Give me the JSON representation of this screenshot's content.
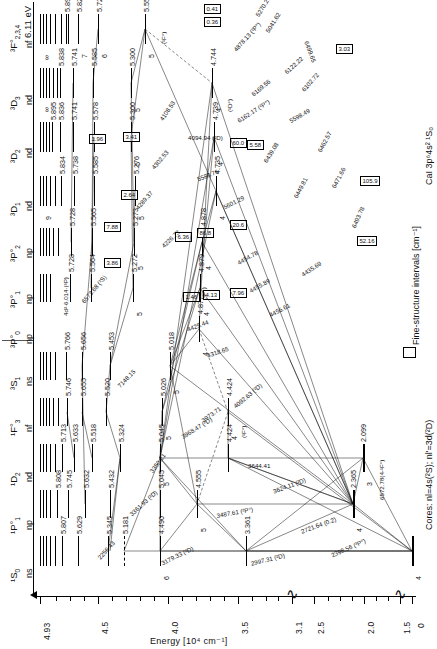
{
  "figure": {
    "species_label": "CaI 3p⁶4s² ¹S₀",
    "cores_label": "Cores: nl=4s(²S); nl'=3d(²D)",
    "fs_key_label": "Fine-structure intervals [cm⁻¹]",
    "axis_title": "Energy [10⁴ cm⁻¹]",
    "axis_ticks": [
      "4.93",
      "4.5",
      "4.0",
      "3.5",
      "3.1",
      "2.5",
      "2.0",
      "1.5",
      "0"
    ],
    "ionization_note": "6.11 eV"
  },
  "rows": [
    {
      "term": "³F°",
      "term_sub": "2,3,4",
      "config": "nf",
      "levels": [
        {
          "n": "5",
          "v": "5.550"
        },
        {
          "n": "6",
          "v": "5.724"
        },
        {
          "n": "7",
          "v": "5.828"
        },
        {
          "n": "8",
          "v": "5.894"
        },
        {
          "n": "9",
          "v": ""
        },
        {
          "n": "10",
          "v": ""
        },
        {
          "n": "∞",
          "v": ""
        }
      ]
    },
    {
      "term": "³D",
      "term_sub": "3",
      "config": "nd",
      "levels": [
        {
          "n": "4",
          "v": "4.744"
        },
        {
          "n": "5",
          "v": "5.300"
        },
        {
          "n": "6",
          "v": "5.585"
        },
        {
          "n": "7",
          "v": "5.741"
        },
        {
          "n": "8",
          "v": "5.838"
        },
        {
          "n": "9",
          "v": ""
        },
        {
          "n": "∞",
          "v": ""
        }
      ]
    },
    {
      "term": "³D",
      "term_sub": "2",
      "config": "nd",
      "levels": [
        {
          "n": "4",
          "v": "4.739"
        },
        {
          "n": "5",
          "v": "5.300"
        },
        {
          "n": "6",
          "v": "5.578"
        },
        {
          "n": "7",
          "v": "5.741"
        },
        {
          "n": "8",
          "v": "5.836"
        },
        {
          "n": "9",
          "v": "5.895"
        },
        {
          "n": "∞",
          "v": ""
        }
      ]
    },
    {
      "term": "³D",
      "term_sub": "1",
      "config": "nd",
      "levels": [
        {
          "n": "4",
          "v": "4.735"
        },
        {
          "n": "5",
          "v": "5.276"
        },
        {
          "n": "6",
          "v": "5.585"
        },
        {
          "n": "7",
          "v": "5.738"
        },
        {
          "n": "8",
          "v": "5.834"
        },
        {
          "n": "9",
          "v": ""
        },
        {
          "n": "∞",
          "v": ""
        }
      ]
    },
    {
      "term": "³P°",
      "term_sub": "2",
      "config": "np",
      "levels": [
        {
          "n": "4",
          "v": "4.878"
        },
        {
          "n": "5",
          "v": "5.273"
        },
        {
          "n": "6",
          "v": "5.565"
        },
        {
          "n": "7",
          "v": "5.728"
        },
        {
          "n": "8",
          "v": "5.826"
        },
        {
          "n": "9",
          "v": ""
        },
        {
          "n": "∞",
          "v": ""
        }
      ]
    },
    {
      "term": "³P°",
      "term_sub": "1",
      "config": "np",
      "levels": [
        {
          "n": "4",
          "v": "4.879"
        },
        {
          "n": "5",
          "v": "5.272"
        },
        {
          "n": "6",
          "v": "5.564"
        },
        {
          "n": "7",
          "v": "5.728"
        },
        {
          "n": "8",
          "v": "5.825"
        },
        {
          "n": "9",
          "v": ""
        },
        {
          "n": "∞",
          "v": ""
        }
      ]
    },
    {
      "term": "³P°",
      "term_sub": "0",
      "config": "np",
      "levels": [
        {
          "n": "4",
          "v": "4.877"
        },
        {
          "n": "5",
          "v": "5.271"
        },
        {
          "n": "6",
          "v": "5.563"
        },
        {
          "n": "7",
          "v": "5.727"
        },
        {
          "n": "8",
          "v": "5.824"
        },
        {
          "n": "9",
          "v": ""
        },
        {
          "n": "∞",
          "v": ""
        }
      ]
    },
    {
      "term": "³S",
      "term_sub": "1",
      "config": "ns",
      "levels": [
        {
          "n": "5",
          "v": "5.018"
        },
        {
          "n": "6",
          "v": "5.453"
        },
        {
          "n": "7",
          "v": "5.656"
        },
        {
          "n": "8",
          "v": "5.766"
        },
        {
          "n": "9",
          "v": "5.834"
        },
        {
          "n": "∞",
          "v": ""
        }
      ]
    },
    {
      "term": "¹F°",
      "term_sub": "3",
      "config": "nf",
      "levels": [
        {
          "n": "4",
          "v": "4.424"
        },
        {
          "n": "5",
          "v": "5.026"
        },
        {
          "n": "6",
          "v": "5.520"
        },
        {
          "n": "7",
          "v": "5.655"
        },
        {
          "n": "8",
          "v": "5.746"
        },
        {
          "n": "9",
          "v": "5.815"
        },
        {
          "n": "∞",
          "v": ""
        }
      ]
    },
    {
      "term": "¹D",
      "term_sub": "2",
      "config": "nd",
      "levels": [
        {
          "n": "3",
          "v": "2.099"
        },
        {
          "n": "4",
          "v": "4.424"
        },
        {
          "n": "5",
          "v": "5.045"
        },
        {
          "n": "6",
          "v": "5.324"
        },
        {
          "n": "7",
          "v": "5.518"
        },
        {
          "n": "8",
          "v": "5.633"
        },
        {
          "n": "9",
          "v": "5.713"
        },
        {
          "n": "10",
          "v": ""
        },
        {
          "n": "∞",
          "v": ""
        }
      ]
    },
    {
      "term": "¹P°",
      "term_sub": "1",
      "config": "np",
      "levels": [
        {
          "n": "4",
          "v": "2.365"
        },
        {
          "n": "5",
          "v": "4.555"
        },
        {
          "n": "6",
          "v": "5.045"
        },
        {
          "n": "7",
          "v": "5.432"
        },
        {
          "n": "8",
          "v": "5.632"
        },
        {
          "n": "9",
          "v": "5.745"
        },
        {
          "n": "10",
          "v": "5.808"
        },
        {
          "n": "∞",
          "v": ""
        }
      ]
    },
    {
      "term": "¹S",
      "term_sub": "0",
      "config": "ns",
      "levels": [
        {
          "n": "4",
          "v": "0"
        },
        {
          "n": "5",
          "v": "3.361"
        },
        {
          "n": "6",
          "v": "4.490"
        },
        {
          "n": "7",
          "v": "5.181"
        },
        {
          "n": "8",
          "v": "5.345"
        },
        {
          "n": "9",
          "v": "5.629"
        },
        {
          "n": "10",
          "v": "5.807"
        },
        {
          "n": "11",
          "v": "5.188"
        },
        {
          "n": "∞",
          "v": ""
        }
      ]
    }
  ],
  "fine_structure_intervals": [
    {
      "value": "0.41"
    },
    {
      "value": "0.36"
    },
    {
      "value": "2.54"
    },
    {
      "value": "52.16"
    },
    {
      "value": "105.9"
    },
    {
      "value": "60.0"
    },
    {
      "value": "5.58"
    },
    {
      "value": "3.41"
    },
    {
      "value": "1.96"
    },
    {
      "value": "2.64"
    },
    {
      "value": "7.88"
    },
    {
      "value": "3.86"
    },
    {
      "value": "6.36"
    },
    {
      "value": "86.8"
    },
    {
      "value": "20.6"
    },
    {
      "value": "1.46"
    },
    {
      "value": "4.13"
    },
    {
      "value": "7.96"
    },
    {
      "value": "3.03"
    }
  ],
  "transitions": [
    {
      "wl": "5270.27"
    },
    {
      "wl": "5041.62"
    },
    {
      "wl": "4298.99 (²P°)"
    },
    {
      "wl": "4878.13 (²P°)"
    },
    {
      "wl": "4585.87 (²F°)"
    },
    {
      "wl": "6499.65"
    },
    {
      "wl": "6169.56"
    },
    {
      "wl": "6169.04"
    },
    {
      "wl": "6162.17 (²P°)"
    },
    {
      "wl": "6122.22"
    },
    {
      "wl": "6102.72"
    },
    {
      "wl": "5598.49"
    },
    {
      "wl": "5588.76"
    },
    {
      "wl": "5601.29"
    },
    {
      "wl": "5857.45"
    },
    {
      "wl": "5867.56"
    },
    {
      "wl": "6439.08"
    },
    {
      "wl": "6449.81"
    },
    {
      "wl": "6462.57"
    },
    {
      "wl": "6471.66"
    },
    {
      "wl": "6493.78"
    },
    {
      "wl": "4454.78"
    },
    {
      "wl": "4455.89"
    },
    {
      "wl": "4456.61"
    },
    {
      "wl": "4435.69"
    },
    {
      "wl": "4425.44"
    },
    {
      "wl": "4318.65"
    },
    {
      "wl": "4302.53"
    },
    {
      "wl": "4289.37"
    },
    {
      "wl": "4226.73"
    },
    {
      "wl": "4108.53"
    },
    {
      "wl": "4094.94 (²D)"
    },
    {
      "wl": "4098.53 (²D)"
    },
    {
      "wl": "4092.63 (²D)"
    },
    {
      "wl": "3973.71"
    },
    {
      "wl": "3968.47 (²D)"
    },
    {
      "wl": "3644.41"
    },
    {
      "wl": "3624.11 (²D)"
    },
    {
      "wl": "3487.61 (²P°)"
    },
    {
      "wl": "3361.93 (²D)"
    },
    {
      "wl": "3350.21"
    },
    {
      "wl": "3179.33 (²D)"
    },
    {
      "wl": "2997.31 (²D)"
    },
    {
      "wl": "2998.22"
    },
    {
      "wl": "2721.64 (0.2)"
    },
    {
      "wl": "2398.56 (³P°)"
    },
    {
      "wl": "2256.43"
    },
    {
      "wl": "6102.72"
    },
    {
      "wl": "6572.78 (³P°)"
    },
    {
      "wl": "6572.78(4-¹F°)"
    },
    {
      "wl": "7148.15"
    },
    {
      "wl": "6573.68 (²S)"
    },
    {
      "wl": "5588.76"
    },
    {
      "wl": "6439.08"
    },
    {
      "wl": "4425.44"
    },
    {
      "wl": "5512.98"
    },
    {
      "wl": "4283.01"
    },
    {
      "wl": "6439.07(0.25)"
    },
    {
      "wl": "4226.73 (¹P°)"
    }
  ],
  "special_labels": [
    {
      "t": "(¹F°)"
    },
    {
      "t": "(¹D°)"
    },
    {
      "t": "(³P°)"
    },
    {
      "t": "(²S)"
    },
    {
      "t": "(²D)"
    },
    {
      "t": "(²P°)"
    }
  ]
}
